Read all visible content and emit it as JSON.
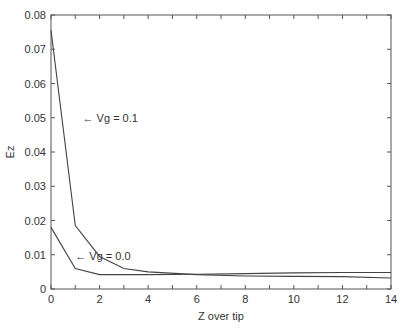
{
  "chart_data": {
    "type": "line",
    "title": "",
    "xlabel": "Z over tip",
    "ylabel": "Ez",
    "xlim": [
      0,
      14
    ],
    "ylim": [
      0,
      0.08
    ],
    "xticks": [
      "0",
      "2",
      "4",
      "6",
      "8",
      "10",
      "12",
      "14"
    ],
    "yticks": [
      "0",
      "0.01",
      "0.02",
      "0.03",
      "0.04",
      "0.05",
      "0.06",
      "0.07",
      "0.08"
    ],
    "grid": false,
    "legend": "inline annotations",
    "series": [
      {
        "name": "Vg=0.1",
        "x": [
          0,
          1,
          2,
          3,
          4,
          6,
          8,
          10,
          12,
          14
        ],
        "values": [
          0.0755,
          0.0185,
          0.0095,
          0.006,
          0.005,
          0.0042,
          0.0038,
          0.0037,
          0.0036,
          0.0032
        ]
      },
      {
        "name": "Vg=0.0",
        "x": [
          0,
          1,
          2,
          4,
          6,
          8,
          10,
          12,
          14
        ],
        "values": [
          0.018,
          0.006,
          0.0042,
          0.0042,
          0.0043,
          0.0045,
          0.0047,
          0.0048,
          0.0048
        ]
      }
    ],
    "annotations": [
      {
        "text": "← Vg = 0.1",
        "x": 1.3,
        "y": 0.05
      },
      {
        "text": "← Vg = 0.0",
        "x": 1.0,
        "y": 0.0095
      }
    ]
  }
}
